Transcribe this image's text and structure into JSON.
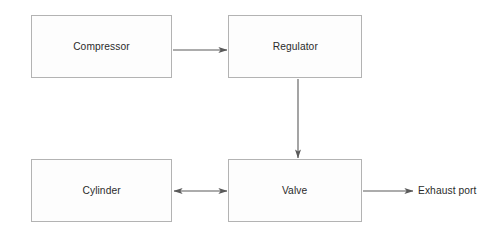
{
  "diagram": {
    "background_color": "#ffffff",
    "node_fill": "#fdfdfd",
    "node_stroke": "#b3b3b3",
    "edge_color": "#5a5a5a",
    "text_color": "#2b2b2b",
    "nodes": [
      {
        "id": "compressor",
        "label": "Compressor",
        "x": 31,
        "y": 15,
        "w": 141,
        "h": 63
      },
      {
        "id": "regulator",
        "label": "Regulator",
        "x": 228,
        "y": 15,
        "w": 134,
        "h": 63
      },
      {
        "id": "cylinder",
        "label": "Cylinder",
        "x": 31,
        "y": 159,
        "w": 141,
        "h": 63
      },
      {
        "id": "valve",
        "label": "Valve",
        "x": 228,
        "y": 159,
        "w": 134,
        "h": 63
      }
    ],
    "labels": [
      {
        "id": "exhaust-port",
        "text": "Exhaust port",
        "x": 418,
        "y": 191
      }
    ],
    "edges": [
      {
        "id": "compressor-to-regulator",
        "from": "compressor",
        "to": "regulator",
        "arrow": "single"
      },
      {
        "id": "regulator-to-valve",
        "from": "regulator",
        "to": "valve",
        "arrow": "single"
      },
      {
        "id": "cylinder-to-valve",
        "from": "cylinder",
        "to": "valve",
        "arrow": "double"
      },
      {
        "id": "valve-to-exhaust-port",
        "from": "valve",
        "to": "exhaust-port",
        "arrow": "single"
      }
    ]
  }
}
